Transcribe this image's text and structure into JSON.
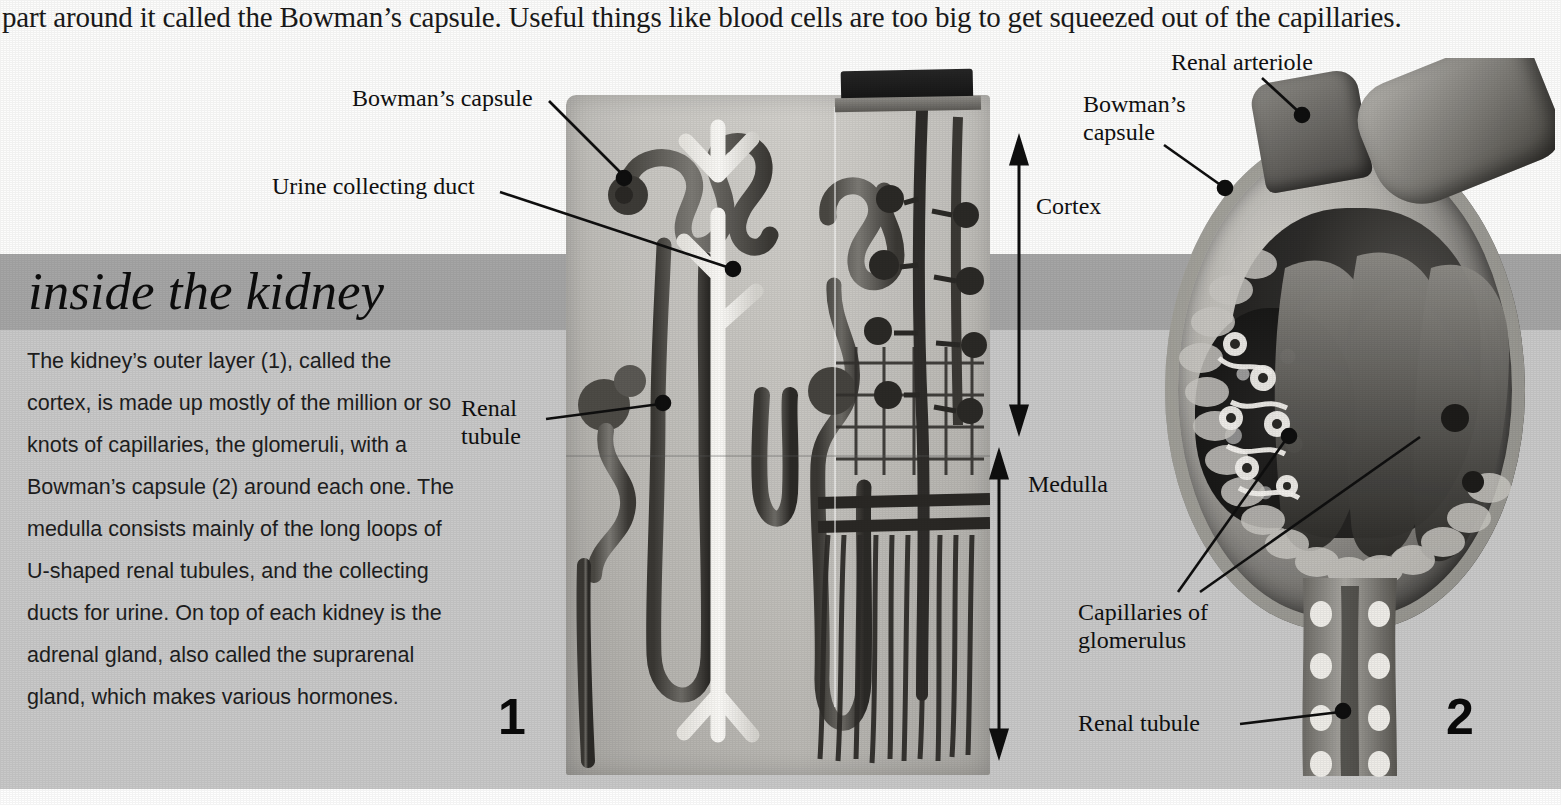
{
  "page": {
    "width": 1561,
    "height": 805,
    "intro_text": "part around it called the Bowman’s capsule. Useful things like blood cells are too big to get squeezed out of the capillaries."
  },
  "headline": {
    "text": "inside the kidney",
    "band_color": "#a6a6a6"
  },
  "body": {
    "paragraph": "The kidney’s outer layer (1), called the cortex, is made up mostly of the million or so knots of capillaries, the glomeruli, with a Bowman’s capsule (2) around each one. The medulla consists mainly of the long loops of U-shaped renal tubules, and the collecting ducts for urine. On top of each kidney is the adrenal gland, also called the suprarenal gland, which makes various hormones.",
    "panel_color": "#c9c9c9"
  },
  "figure1": {
    "number": "1",
    "labels": {
      "bowmans_capsule": "Bowman’s capsule",
      "urine_collecting_duct": "Urine collecting duct",
      "renal_tubule": "Renal\ntubule",
      "cortex": "Cortex",
      "medulla": "Medulla"
    }
  },
  "figure2": {
    "number": "2",
    "labels": {
      "renal_arteriole": "Renal arteriole",
      "bowmans_capsule": "Bowman’s\ncapsule",
      "capillaries_of_glomerulus": "Capillaries of\nglomerulus",
      "renal_tubule": "Renal tubule"
    }
  },
  "colors": {
    "ink": "#101010",
    "band_dark": "#a6a6a6",
    "band_light": "#c9c9c9",
    "page_white": "#ffffff"
  }
}
